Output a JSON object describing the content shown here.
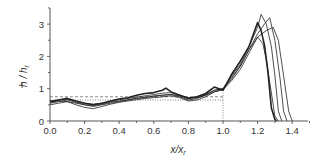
{
  "chart_data": {
    "type": "line",
    "title": "",
    "xlabel": "x/x_r",
    "ylabel": "h̄ / h_r",
    "xlim": [
      0.0,
      1.5
    ],
    "ylim": [
      0,
      3.5
    ],
    "xticks": [
      "0.0",
      "0.2",
      "0.4",
      "0.6",
      "0.8",
      "1.0",
      "1.2",
      "1.4"
    ],
    "yticks": [
      "0",
      "1",
      "2",
      "3"
    ],
    "grid": false,
    "legend": null,
    "reference_lines": [
      {
        "type": "vertical",
        "x": 1.0,
        "y_to": 1.0,
        "style": "dotted"
      },
      {
        "type": "horizontal",
        "y": 0.75,
        "x_to": 1.0,
        "style": "dashed"
      },
      {
        "type": "horizontal",
        "y": 0.65,
        "x_to": 1.0,
        "style": "dotted"
      }
    ],
    "series": [
      {
        "name": "run-1 (bold)",
        "width": 1.6,
        "x": [
          0,
          0.05,
          0.1,
          0.15,
          0.2,
          0.25,
          0.3,
          0.35,
          0.4,
          0.45,
          0.5,
          0.55,
          0.6,
          0.65,
          0.67,
          0.7,
          0.75,
          0.8,
          0.85,
          0.9,
          0.95,
          1.0,
          1.05,
          1.1,
          1.15,
          1.2,
          1.22,
          1.24,
          1.26,
          1.28,
          1.3,
          1.31
        ],
        "y": [
          0.6,
          0.65,
          0.7,
          0.62,
          0.55,
          0.5,
          0.55,
          0.62,
          0.68,
          0.72,
          0.8,
          0.85,
          0.88,
          0.95,
          1.02,
          0.9,
          0.8,
          0.7,
          0.75,
          0.85,
          1.05,
          0.95,
          1.45,
          1.85,
          2.3,
          3.05,
          2.8,
          2.35,
          1.5,
          0.4,
          0.05,
          0.0
        ]
      },
      {
        "name": "run-2",
        "width": 0.8,
        "x": [
          0,
          0.05,
          0.1,
          0.15,
          0.2,
          0.25,
          0.3,
          0.35,
          0.4,
          0.45,
          0.5,
          0.55,
          0.6,
          0.65,
          0.7,
          0.75,
          0.8,
          0.85,
          0.9,
          0.95,
          1.0,
          1.05,
          1.1,
          1.15,
          1.2,
          1.22,
          1.25,
          1.28,
          1.3,
          1.32,
          1.34
        ],
        "y": [
          0.55,
          0.6,
          0.65,
          0.58,
          0.5,
          0.45,
          0.5,
          0.55,
          0.6,
          0.65,
          0.7,
          0.72,
          0.78,
          0.8,
          0.82,
          0.75,
          0.65,
          0.7,
          0.8,
          0.95,
          1.0,
          1.4,
          1.75,
          2.3,
          2.9,
          3.3,
          3.0,
          2.3,
          1.4,
          0.3,
          0.0
        ]
      },
      {
        "name": "run-3",
        "width": 0.8,
        "x": [
          0,
          0.05,
          0.1,
          0.15,
          0.2,
          0.25,
          0.3,
          0.35,
          0.4,
          0.45,
          0.5,
          0.55,
          0.6,
          0.65,
          0.7,
          0.75,
          0.8,
          0.85,
          0.9,
          0.95,
          1.0,
          1.05,
          1.1,
          1.15,
          1.2,
          1.24,
          1.27,
          1.3,
          1.33,
          1.35,
          1.37
        ],
        "y": [
          0.5,
          0.55,
          0.6,
          0.5,
          0.42,
          0.38,
          0.45,
          0.52,
          0.58,
          0.62,
          0.66,
          0.7,
          0.72,
          0.75,
          0.78,
          0.72,
          0.62,
          0.65,
          0.75,
          0.9,
          0.98,
          1.3,
          1.7,
          2.2,
          2.7,
          3.0,
          3.2,
          2.5,
          1.3,
          0.3,
          0.0
        ]
      },
      {
        "name": "run-4",
        "width": 0.8,
        "x": [
          0,
          0.05,
          0.1,
          0.15,
          0.2,
          0.25,
          0.3,
          0.35,
          0.4,
          0.45,
          0.5,
          0.55,
          0.6,
          0.65,
          0.7,
          0.75,
          0.8,
          0.85,
          0.9,
          0.95,
          1.0,
          1.05,
          1.1,
          1.15,
          1.2,
          1.25,
          1.29,
          1.32,
          1.35,
          1.38,
          1.4
        ],
        "y": [
          0.58,
          0.62,
          0.6,
          0.55,
          0.5,
          0.48,
          0.52,
          0.58,
          0.62,
          0.66,
          0.7,
          0.74,
          0.76,
          0.8,
          0.82,
          0.78,
          0.7,
          0.72,
          0.8,
          0.9,
          0.97,
          1.25,
          1.6,
          2.1,
          2.6,
          2.8,
          2.9,
          2.5,
          1.4,
          0.3,
          0.0
        ]
      },
      {
        "name": "run-5",
        "width": 0.8,
        "x": [
          0,
          0.05,
          0.1,
          0.15,
          0.2,
          0.25,
          0.3,
          0.35,
          0.4,
          0.45,
          0.5,
          0.55,
          0.6,
          0.65,
          0.7,
          0.75,
          0.8,
          0.85,
          0.9,
          0.95,
          1.0,
          1.05,
          1.1,
          1.15,
          1.2,
          1.23,
          1.25,
          1.27,
          1.29,
          1.3,
          1.32
        ],
        "y": [
          0.62,
          0.65,
          0.68,
          0.6,
          0.55,
          0.52,
          0.55,
          0.6,
          0.66,
          0.7,
          0.74,
          0.78,
          0.82,
          0.86,
          0.88,
          0.8,
          0.72,
          0.74,
          0.82,
          0.95,
          1.0,
          1.35,
          1.7,
          2.2,
          2.6,
          2.4,
          1.9,
          1.2,
          0.5,
          0.15,
          0.0
        ]
      }
    ]
  },
  "axes": {
    "x_label": "x/x",
    "x_label_sub": "r",
    "y_label_main": "h / h",
    "y_label_sub": "r"
  }
}
